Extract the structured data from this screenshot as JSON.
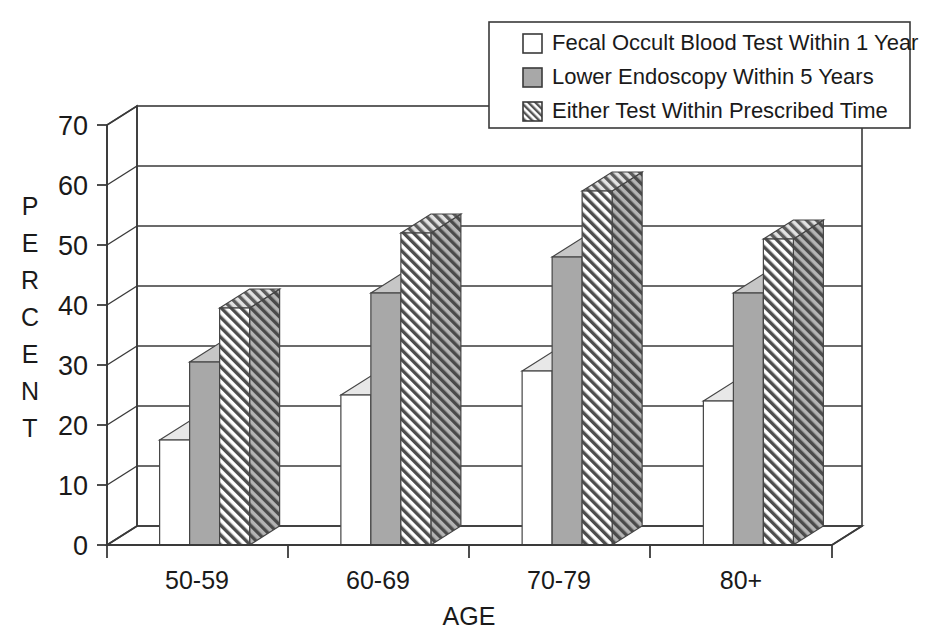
{
  "chart_data": {
    "type": "bar",
    "title": "",
    "subtitle": "",
    "xlabel": "AGE",
    "ylabel": "PERCENT",
    "categories": [
      "50-59",
      "60-69",
      "70-79",
      "80+"
    ],
    "series": [
      {
        "name": "Fecal Occult Blood Test Within 1 Year",
        "values": [
          17.5,
          25,
          29,
          24
        ],
        "swatch": "white",
        "color": "#ffffff"
      },
      {
        "name": "Lower Endoscopy Within 5 Years",
        "values": [
          30.5,
          42,
          48,
          42
        ],
        "swatch": "solid-gray",
        "color": "#a8a8a8"
      },
      {
        "name": "Either Test Within Prescribed Time",
        "values": [
          39.5,
          52,
          59,
          51
        ],
        "swatch": "diagonal-hatch",
        "color": "#9d9d9d"
      }
    ],
    "ylim": [
      0,
      70
    ],
    "yticks": [
      0,
      10,
      20,
      30,
      40,
      50,
      60,
      70
    ],
    "ytick_labels": [
      "0",
      "10",
      "20",
      "30",
      "40",
      "50",
      "60",
      "70"
    ],
    "grid": true,
    "grid_axis": "y",
    "legend_position": "top-right",
    "style": "3d-column",
    "background": "#ffffff",
    "axis_color": "#3a3a3a"
  },
  "legend": {
    "items": [
      {
        "label": "Fecal Occult Blood Test Within 1 Year",
        "swatch": "white"
      },
      {
        "label": "Lower Endoscopy Within 5 Years",
        "swatch": "solid-gray"
      },
      {
        "label": "Either Test Within Prescribed Time",
        "swatch": "diagonal-hatch"
      }
    ]
  },
  "axes": {
    "y_label_letters": [
      "P",
      "E",
      "R",
      "C",
      "E",
      "N",
      "T"
    ],
    "x_title": "AGE"
  }
}
